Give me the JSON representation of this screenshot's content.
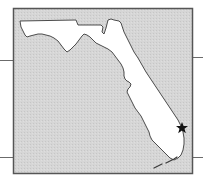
{
  "map": {
    "region": "Florida",
    "marker": {
      "type": "star",
      "label": "location-marker"
    },
    "colors": {
      "water": "#d3d3d3",
      "land": "#ffffff",
      "frame": "#555555",
      "coast": "#3a3a3a",
      "marker": "#111111",
      "leader_lines": "#6b6b6b"
    }
  }
}
